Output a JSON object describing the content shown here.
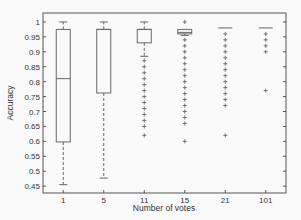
{
  "chart_data": {
    "type": "box",
    "title": "",
    "xlabel": "Number of votes",
    "ylabel": "Accuracy",
    "ylim": [
      0.427,
      1.03
    ],
    "yticks": [
      0.45,
      0.5,
      0.55,
      0.6,
      0.65,
      0.7,
      0.75,
      0.8,
      0.85,
      0.9,
      0.95,
      1
    ],
    "ytick_labels": [
      "0.45",
      "0.5",
      "0.55",
      "0.6",
      "0.65",
      "0.7",
      "0.75",
      "0.8",
      "0.85",
      "0.9",
      "0.95",
      "1"
    ],
    "categories": [
      "1",
      "5",
      "11",
      "15",
      "21",
      "101"
    ],
    "grid": false,
    "boxes": [
      {
        "label": "1",
        "whisker_low": 0.455,
        "q1": 0.598,
        "median": 0.81,
        "q3": 0.975,
        "whisker_high": 1.0,
        "outliers": []
      },
      {
        "label": "5",
        "whisker_low": 0.477,
        "q1": 0.762,
        "median": 0.975,
        "q3": 0.975,
        "whisker_high": 1.0,
        "outliers": []
      },
      {
        "label": "11",
        "whisker_low": 0.885,
        "q1": 0.93,
        "median": 0.975,
        "q3": 0.975,
        "whisker_high": 1.0,
        "outliers": [
          0.87,
          0.85,
          0.83,
          0.81,
          0.79,
          0.77,
          0.75,
          0.73,
          0.71,
          0.69,
          0.67,
          0.65,
          0.62
        ]
      },
      {
        "label": "15",
        "whisker_low": 0.955,
        "q1": 0.96,
        "median": 0.965,
        "q3": 0.975,
        "whisker_high": 0.975,
        "outliers": [
          1.0,
          0.94,
          0.92,
          0.9,
          0.88,
          0.86,
          0.84,
          0.82,
          0.8,
          0.78,
          0.76,
          0.74,
          0.72,
          0.7,
          0.68,
          0.66,
          0.6
        ]
      },
      {
        "label": "21",
        "whisker_low": 0.98,
        "q1": 0.98,
        "median": 0.98,
        "q3": 0.98,
        "whisker_high": 0.98,
        "outliers": [
          0.96,
          0.94,
          0.92,
          0.9,
          0.88,
          0.86,
          0.84,
          0.82,
          0.8,
          0.78,
          0.76,
          0.74,
          0.72,
          0.62
        ]
      },
      {
        "label": "101",
        "whisker_low": 0.98,
        "q1": 0.98,
        "median": 0.98,
        "q3": 0.98,
        "whisker_high": 0.98,
        "outliers": [
          0.96,
          0.94,
          0.92,
          0.9,
          0.77
        ]
      }
    ]
  },
  "axes": {
    "xlabel": "Number of votes",
    "ylabel": "Accuracy"
  }
}
